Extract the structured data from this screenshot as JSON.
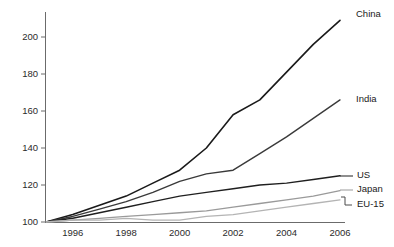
{
  "chart_data": {
    "type": "line",
    "title": "",
    "subtitle": "",
    "xlabel": "",
    "ylabel": "",
    "xlim": [
      1995,
      2006
    ],
    "ylim": [
      100,
      208
    ],
    "grid": false,
    "legend_position": "right-inline-labels",
    "index_base": "1995 = 100",
    "x": [
      1995,
      1996,
      1997,
      1998,
      1999,
      2000,
      2001,
      2002,
      2003,
      2004,
      2005,
      2006
    ],
    "xticks": [
      1996,
      1998,
      2000,
      2002,
      2004,
      2006
    ],
    "xticklabels": [
      "1996",
      "1998",
      "2000",
      "2002",
      "2004",
      "2006"
    ],
    "yticks": [
      100,
      120,
      140,
      160,
      180,
      200
    ],
    "yticklabels": [
      "100",
      "120",
      "140",
      "160",
      "180",
      "200"
    ],
    "series": [
      {
        "name": "China",
        "label": "China",
        "color": "#1a1a1a",
        "width": 1.6,
        "values": [
          100,
          104,
          109,
          114,
          121,
          128,
          140,
          158,
          166,
          181,
          196,
          209
        ]
      },
      {
        "name": "India",
        "label": "India",
        "color": "#3a3a3a",
        "width": 1.4,
        "values": [
          100,
          103,
          107,
          111,
          116,
          122,
          126,
          128,
          137,
          146,
          156,
          166
        ]
      },
      {
        "name": "US",
        "label": "US",
        "color": "#1f1f1f",
        "width": 1.4,
        "values": [
          100,
          102,
          105,
          108,
          111,
          114,
          116,
          118,
          120,
          121,
          123,
          125
        ]
      },
      {
        "name": "Japan",
        "label": "Japan",
        "color": "#9a9a9a",
        "width": 1.3,
        "values": [
          100,
          101,
          102,
          103,
          104,
          105,
          106,
          108,
          110,
          112,
          114,
          117
        ]
      },
      {
        "name": "EU-15",
        "label": "EU-15",
        "color": "#b4b4b4",
        "width": 1.3,
        "values": [
          100,
          101,
          101,
          102,
          101,
          101,
          103,
          104,
          106,
          108,
          110,
          112
        ]
      }
    ],
    "annotations": [
      {
        "label": "China",
        "x": 2006,
        "y": 209
      },
      {
        "label": "India",
        "x": 2006,
        "y": 166
      },
      {
        "label": "US",
        "x": 2006,
        "y": 125
      },
      {
        "label": "Japan",
        "x": 2006,
        "y": 117
      },
      {
        "label": "EU-15",
        "x": 2006,
        "y": 112
      }
    ]
  },
  "colors": {
    "axis": "#6b6b6b",
    "text": "#2b2b2b",
    "background": "#ffffff"
  }
}
